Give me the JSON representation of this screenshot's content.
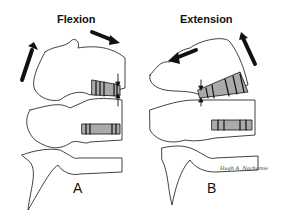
{
  "figure": {
    "panels": [
      {
        "id": "A",
        "title": "Flexion",
        "letter": "A"
      },
      {
        "id": "B",
        "title": "Extension",
        "letter": "B"
      }
    ],
    "signature": "Hugh A. Nachamie",
    "colors": {
      "ink": "#111111",
      "background": "#ffffff",
      "disc_fill": "#999999"
    }
  }
}
